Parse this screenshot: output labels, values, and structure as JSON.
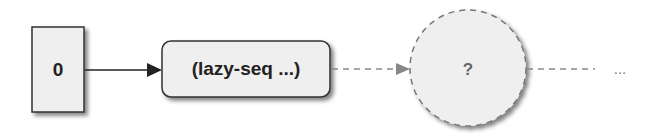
{
  "diagram": {
    "nodes": [
      {
        "id": "head",
        "label": "0",
        "shape": "rectangle",
        "style": "solid"
      },
      {
        "id": "lazy",
        "label": "(lazy-seq ...)",
        "shape": "rounded-rectangle",
        "style": "solid"
      },
      {
        "id": "unrealized",
        "label": "?",
        "shape": "circle",
        "style": "dashed"
      },
      {
        "id": "rest",
        "label": "...",
        "shape": "text",
        "style": "none"
      }
    ],
    "edges": [
      {
        "from": "head",
        "to": "lazy",
        "style": "solid",
        "arrow": true
      },
      {
        "from": "lazy",
        "to": "unrealized",
        "style": "dashed",
        "arrow": true
      },
      {
        "from": "unrealized",
        "to": "rest",
        "style": "dashed",
        "arrow": false
      }
    ],
    "colors": {
      "fill": "#efefef",
      "stroke": "#333333",
      "dashed_stroke": "#777777",
      "text": "#222222"
    }
  }
}
